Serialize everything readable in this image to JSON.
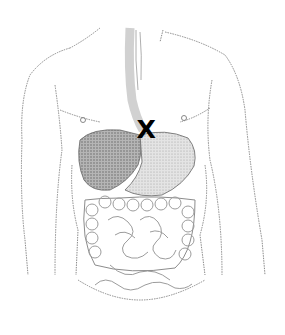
{
  "figure": {
    "organs": [
      "esophagus",
      "liver",
      "stomach",
      "gallbladder",
      "large intestine",
      "small intestine"
    ],
    "colors": {
      "background": "#ffffff",
      "line": "#555555",
      "shading": "#7a7a7a",
      "marker": "#000000"
    }
  },
  "marker": {
    "label": "X",
    "location": "gastroesophageal junction"
  }
}
